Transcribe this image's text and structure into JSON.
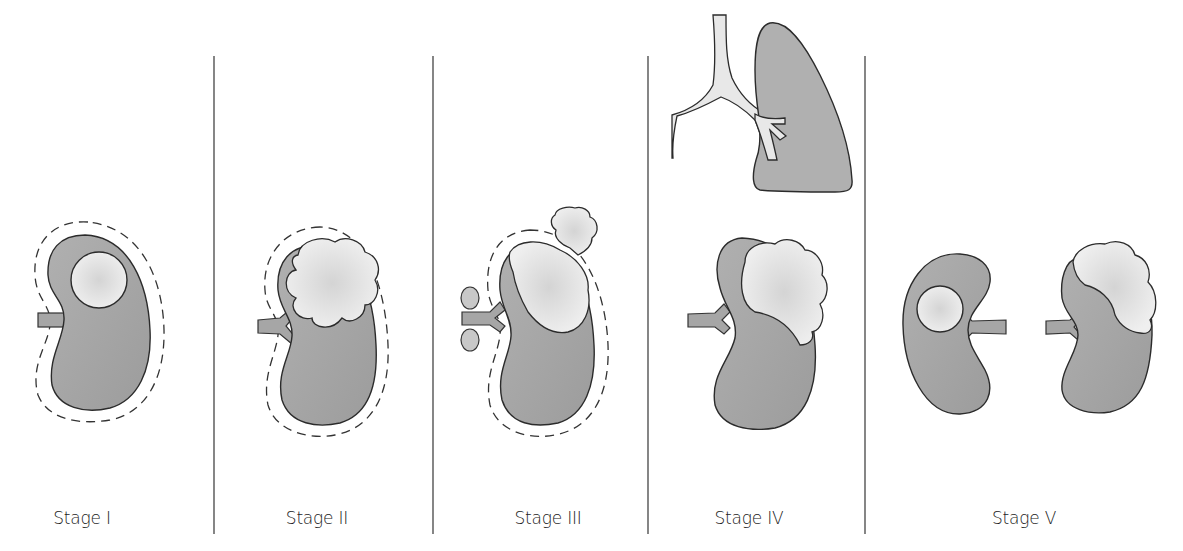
{
  "figure": {
    "colors": {
      "kidney": "#a6a6a6",
      "tumor": "#e6e6e6",
      "outline": "#2b2b2b",
      "lung": "#b3b3b3",
      "bronchus": "#e8e8e8",
      "divider": "#444444"
    },
    "panels": [
      {
        "label": "Stage I",
        "contents": [
          "kidney",
          "small-tumor",
          "capsule-dashed"
        ]
      },
      {
        "label": "Stage II",
        "contents": [
          "kidney",
          "large-tumor",
          "capsule-dashed"
        ]
      },
      {
        "label": "Stage III",
        "contents": [
          "kidney",
          "large-tumor",
          "capsule-dashed",
          "lymph-nodes",
          "peritoneal-spill"
        ]
      },
      {
        "label": "Stage IV",
        "contents": [
          "kidney",
          "large-tumor",
          "lung-metastasis",
          "bronchus"
        ]
      },
      {
        "label": "Stage V",
        "contents": [
          "kidney-left",
          "kidney-right",
          "bilateral-tumors"
        ]
      }
    ]
  }
}
